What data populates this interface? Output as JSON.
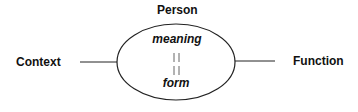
{
  "diagram": {
    "top_label": "Person",
    "left_label": "Context",
    "right_label": "Function",
    "ellipse_top_text": "meaning",
    "ellipse_bottom_text": "form",
    "connector_symbol": "||"
  },
  "colors": {
    "stroke": "#222222",
    "text": "#111111",
    "background": "#ffffff"
  }
}
